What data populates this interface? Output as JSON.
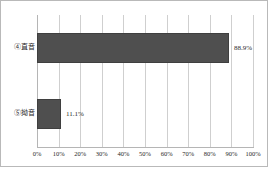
{
  "chart_data": {
    "type": "bar",
    "orientation": "horizontal",
    "title": "",
    "xlabel": "",
    "ylabel": "",
    "categories": [
      "④直音",
      "⑤拗音"
    ],
    "values": [
      88.9,
      11.1
    ],
    "value_labels": [
      "88.9%",
      "11.1%"
    ],
    "xlim": [
      0,
      100
    ],
    "xticks": [
      0,
      10,
      20,
      30,
      40,
      50,
      60,
      70,
      80,
      90,
      100
    ],
    "xtick_labels": [
      "0%",
      "10%",
      "20%",
      "30%",
      "40%",
      "50%",
      "60%",
      "70%",
      "80%",
      "90%",
      "100%"
    ],
    "grid": true,
    "legend": null,
    "bar_color": "#4f4f4f",
    "gridline_color": "#cfcfcf",
    "border_color": "#b9b9b9"
  }
}
